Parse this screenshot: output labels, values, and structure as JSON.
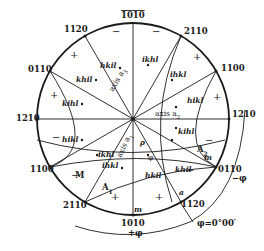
{
  "diagram": {
    "type": "stereographic-projection-hexagonal",
    "pole_labels": {
      "top": "Š0100",
      "p_1010_bar_top": "1̄010",
      "p_1120_bar_upper_left": "1̄1̄ 20",
      "p_0110_left": "01̄ 10",
      "p_1210_left": "12̄ 10",
      "p_1100_lower_left": "11̄ 00",
      "p_2110_lower_left": "21̄ 1̄ 0",
      "p_1010_bottom": "10̄1̄ 0",
      "p_1120_lower_right": "112̄ 0",
      "p_0110_right": "011̄ 0",
      "p_1210_right": "1̄21̄ 0",
      "p_1100_upper_right": "1̄100",
      "p_2110_upper_right": "2̄110"
    },
    "region_indices": [
      "h̄k̄i l",
      "k̄h̄i l",
      "k ī h l",
      "h ī k l",
      "ī k h l",
      "ī h k l",
      "h̄ ī k̄ l",
      "ī k̄ h̄ l",
      "ī h̄ k̄ l",
      "k̄ ī h̄ l",
      "k h ī l",
      "h k ī l"
    ],
    "axis_labels": [
      "axis a₁",
      "axis a₂",
      "axis a₃"
    ],
    "point_labels": [
      "A₁",
      "A₂",
      "M",
      "m",
      "m",
      "a",
      "ρ",
      "φ"
    ],
    "angle_labels": {
      "phi_zero": "φ=0°00′",
      "plus_phi": "+φ",
      "minus_phi": "−φ"
    },
    "signs": [
      "−′",
      "'+",
      "+'",
      "'−",
      "+'",
      "'+",
      "−'",
      "'−",
      "+'",
      "'+",
      "−'",
      "'−"
    ]
  },
  "text": {
    "t_top": "1010",
    "t_1120ul": "1120",
    "t_0110l": "0110",
    "t_1210l": "1210",
    "t_1100ll": "1100",
    "t_2110ll": "2110",
    "t_1010b": "1010",
    "t_1120lr": "1120",
    "t_0110r": "0110",
    "t_1210r": "1210",
    "t_1100ur": "1100",
    "t_2110ur": "2110",
    "ax1": "axis a",
    "ax1s": "1",
    "ax2": "axis a",
    "ax2s": "2",
    "ax3": "axis a",
    "ax3s": "3",
    "i1": "hkil",
    "i2": "khil",
    "i3": "kihl",
    "i4": "hikl",
    "i5": "ikhl",
    "i6": "ihkl",
    "i7": "hikl",
    "i8": "ikhl",
    "i9": "ihkl",
    "i10": "kihl",
    "i11": "khil",
    "i12": "hkil",
    "A1": "A",
    "A1s": "1",
    "A2": "A",
    "A2s": "2",
    "M": "M",
    "m1": "m",
    "m2": "m",
    "a": "a",
    "rho": "ρ",
    "phi": "φ",
    "phi0": "φ=0°00′",
    "pphi": "+φ",
    "mphi": "−φ",
    "s_plus": "+",
    "s_minus": "−"
  }
}
